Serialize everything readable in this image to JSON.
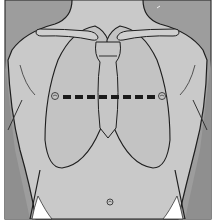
{
  "figure": {
    "title": "Torso outline with lung fields and dashed horizontal marker line",
    "colors": {
      "background_dark": "#9a9a9a",
      "skin": "#c8c8c8",
      "lungs": "#c2c2c2",
      "outline": "#1e1e1e",
      "marker": "#1a1a1a",
      "underwear": "#ffffff"
    },
    "marker_line": {
      "style": "dashed",
      "segments": 8,
      "end_markers": [
        "left-circle",
        "right-circle"
      ]
    },
    "structures": [
      "neck",
      "clavicles",
      "sternum",
      "left-lung",
      "right-lung",
      "heart-notch",
      "arms",
      "navel",
      "waistband"
    ]
  }
}
